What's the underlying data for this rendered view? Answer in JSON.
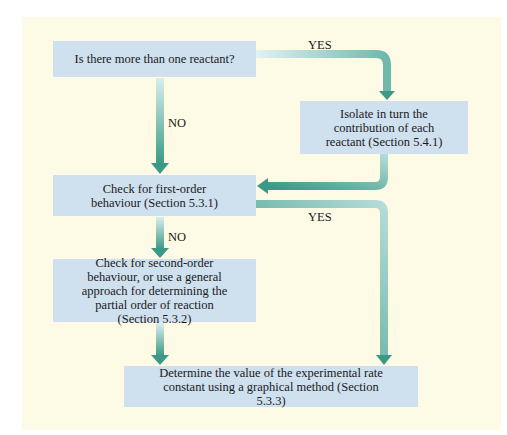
{
  "diagram": {
    "boxes": [
      {
        "id": "q1",
        "text": "Is there more than one reactant?"
      },
      {
        "id": "isolate",
        "text": "Isolate in turn the contribution of each reactant (Section 5.4.1)"
      },
      {
        "id": "first",
        "text": "Check for first-order behaviour (Section 5.3.1)"
      },
      {
        "id": "second",
        "text": "Check for second-order behaviour, or use a general approach for determining the partial order of reaction (Section 5.3.2)"
      },
      {
        "id": "determine",
        "text": "Determine the value of the experimental rate constant using a graphical method (Section 5.3.3)"
      }
    ],
    "labels": {
      "yes1": "YES",
      "no1": "NO",
      "yes2": "YES",
      "no2": "NO"
    },
    "colors": {
      "background": "#fdfae6",
      "box": "#cfe0ef",
      "arrow": "#3a9a86",
      "arrow_light": "#d4ecef"
    }
  }
}
